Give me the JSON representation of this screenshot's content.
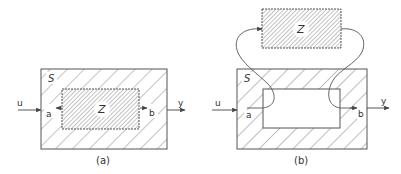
{
  "figure_a": {
    "caption": "(a)",
    "outer_block": "S",
    "inner_block": "Z",
    "input": "u",
    "output": "y",
    "port_left": "a",
    "port_right": "b"
  },
  "figure_b": {
    "caption": "(b)",
    "outer_block": "S",
    "extracted_block": "Z",
    "input": "u",
    "output": "y",
    "port_left": "a",
    "port_right": "b"
  },
  "colors": {
    "line": "#555555",
    "hatch": "#777777",
    "background": "#ffffff"
  }
}
